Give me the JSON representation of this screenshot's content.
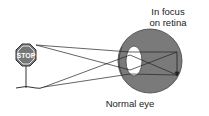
{
  "diagram": {
    "title": "Normal eye",
    "focus_label_line1": "In focus",
    "focus_label_line2": "on retina",
    "sign_text": "STOP",
    "colors": {
      "eyeball": "#7a7a7a",
      "lens": "#ffffff",
      "lines": "#222222"
    }
  }
}
